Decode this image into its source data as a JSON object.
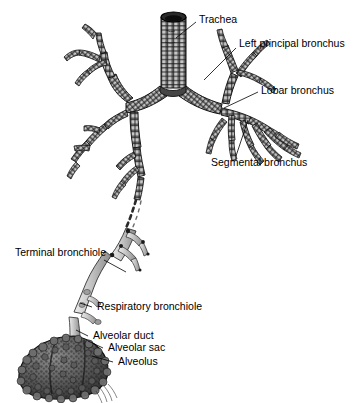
{
  "figure": {
    "background_color": "#ffffff",
    "ink_color": "#000000"
  },
  "labels": {
    "trachea": "Trachea",
    "left_principal_bronchus": "Left principal bronchus",
    "lobar_bronchus": "Lobar bronchus",
    "segmental_bronchus": "Segmental bronchus",
    "terminal_bronchiole": "Terminal bronchiole",
    "respiratory_bronchiole": "Respiratory bronchiole",
    "alveolar_duct": "Alveolar duct",
    "alveolar_sac": "Alveolar sac",
    "alveolus": "Alveolus"
  },
  "structures": {
    "trachea": "cartilage-ringed vertical tube at top center with open dark lumen",
    "carina": "bifurcation into left and right principal bronchi",
    "bronchi": "dark ribbed branching tubes",
    "bronchioles": "smooth light-grey untextured tubes below dashed break",
    "alveolar_sac": "dark stippled grape-like cluster at lower left"
  },
  "colors": {
    "cartilage_dark": "#3a3a3a",
    "cartilage_mid": "#6e6e6e",
    "cartilage_light": "#b4b4b4",
    "bronchiole_fill": "#b9b9b9",
    "alveoli_dark": "#4a4a4a",
    "alveoli_mid": "#777777",
    "outline": "#000000"
  }
}
